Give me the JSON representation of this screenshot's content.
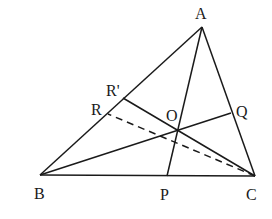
{
  "diagram": {
    "type": "geometry",
    "points": {
      "A": {
        "label": "A",
        "x": 202,
        "y": 27
      },
      "B": {
        "label": "B",
        "x": 40,
        "y": 175
      },
      "C": {
        "label": "C",
        "x": 255,
        "y": 176
      },
      "P": {
        "label": "P",
        "x": 167,
        "y": 176
      },
      "Q": {
        "label": "Q",
        "x": 231,
        "y": 113
      },
      "R": {
        "label": "R",
        "x": 108,
        "y": 114
      },
      "R_prime": {
        "label": "R'",
        "x": 123,
        "y": 98
      },
      "O": {
        "label": "O",
        "x": 178,
        "y": 131
      }
    },
    "segments": [
      {
        "from": "A",
        "to": "B",
        "style": "solid"
      },
      {
        "from": "B",
        "to": "C",
        "style": "solid"
      },
      {
        "from": "C",
        "to": "A",
        "style": "solid"
      },
      {
        "from": "A",
        "to": "P",
        "style": "solid"
      },
      {
        "from": "B",
        "to": "Q",
        "style": "solid"
      },
      {
        "from": "C",
        "to": "R'",
        "style": "solid"
      },
      {
        "from": "C",
        "to": "R",
        "style": "dashed"
      }
    ]
  }
}
